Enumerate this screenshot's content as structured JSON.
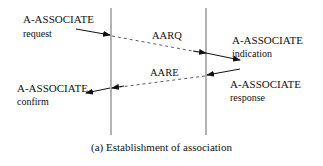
{
  "diagram": {
    "caption": "(a) Establishment of association",
    "left_top": {
      "primitive": "A-ASSOCIATE",
      "kind": "request"
    },
    "right_top": {
      "primitive": "A-ASSOCIATE",
      "kind": "indication"
    },
    "right_bottom": {
      "primitive": "A-ASSOCIATE",
      "kind": "response"
    },
    "left_bottom": {
      "primitive": "A-ASSOCIATE",
      "kind": "confirm"
    },
    "messages": [
      {
        "label": "AARQ",
        "direction": "left-to-right"
      },
      {
        "label": "AARE",
        "direction": "right-to-left"
      }
    ],
    "colors": {
      "line": "#555555",
      "arrow": "#111111"
    }
  }
}
